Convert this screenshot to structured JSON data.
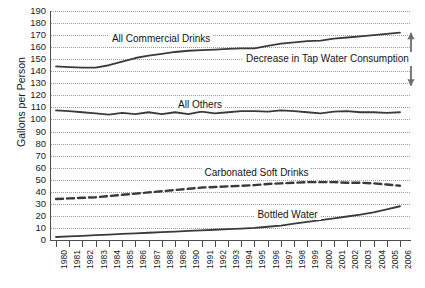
{
  "chart_data": {
    "type": "line",
    "title": "",
    "xlabel": "",
    "ylabel": "Gallons per Person",
    "ylim": [
      0,
      190
    ],
    "ytick_step": 10,
    "grid": true,
    "legend_position": "inline-labels",
    "categories": [
      1980,
      1981,
      1982,
      1983,
      1984,
      1985,
      1986,
      1987,
      1988,
      1989,
      1990,
      1991,
      1992,
      1993,
      1994,
      1995,
      1996,
      1997,
      1998,
      1999,
      2000,
      2001,
      2002,
      2003,
      2004,
      2005,
      2006
    ],
    "yticks": [
      0,
      10,
      20,
      30,
      40,
      50,
      60,
      70,
      80,
      90,
      100,
      110,
      120,
      130,
      140,
      150,
      160,
      170,
      180,
      190
    ],
    "xticks": [
      "1980",
      "1981",
      "1982",
      "1983",
      "1984",
      "1985",
      "1986",
      "1987",
      "1988",
      "1989",
      "1990",
      "1991",
      "1992",
      "1993",
      "1994",
      "1995",
      "1996",
      "1997",
      "1998",
      "1999",
      "2000",
      "2001",
      "2002",
      "2003",
      "2004",
      "2005",
      "2006"
    ],
    "series": [
      {
        "name": "All Commercial Drinks",
        "style": "solid",
        "color": "#3a3a3a",
        "label_x_year": 1984,
        "label_y_value": 167,
        "values": [
          144,
          143.5,
          143,
          143,
          145,
          148,
          151,
          153,
          154.5,
          156,
          157,
          157.5,
          158,
          158.5,
          159,
          159,
          161,
          163,
          164,
          165,
          165.5,
          167,
          168,
          169,
          170,
          171,
          172
        ]
      },
      {
        "name": "All Others",
        "style": "solid",
        "color": "#3a3a3a",
        "label_x_year": 1989,
        "label_y_value": 112,
        "values": [
          107.5,
          107,
          106,
          105,
          104,
          105.5,
          104.5,
          106,
          104.5,
          106,
          104.5,
          106.5,
          105,
          106,
          107,
          107,
          106.5,
          107.5,
          107,
          106,
          105,
          106.5,
          107,
          106,
          106,
          105.5,
          106
        ]
      },
      {
        "name": "Carbonated Soft Drinks",
        "style": "dashed",
        "color": "#3a3a3a",
        "label_x_year": 1991,
        "label_y_value": 56,
        "values": [
          34,
          34.5,
          35,
          35.5,
          36.5,
          37.5,
          38.5,
          39.5,
          40.5,
          41.5,
          42.5,
          43.5,
          44,
          44.5,
          45,
          45.5,
          46.5,
          47,
          47.5,
          48,
          48,
          48,
          47.5,
          47.5,
          47,
          46,
          45
        ]
      },
      {
        "name": "Bottled Water",
        "style": "solid",
        "color": "#3a3a3a",
        "label_x_year": 1995,
        "label_y_value": 21,
        "values": [
          2.5,
          3,
          3.5,
          4,
          4.5,
          5,
          5.5,
          6,
          6.5,
          7,
          7.5,
          8,
          8.5,
          9,
          9.5,
          10,
          11,
          12,
          13.5,
          15,
          16.5,
          18,
          19.5,
          21,
          23,
          25.5,
          28
        ]
      }
    ],
    "annotations": [
      {
        "name": "decrease-in-tap-water-consumption",
        "text": "Decrease in Tap Water Consumption",
        "arrow": "double-headed-vertical",
        "arrow_top_value": 172,
        "arrow_bottom_value": 128
      }
    ]
  }
}
